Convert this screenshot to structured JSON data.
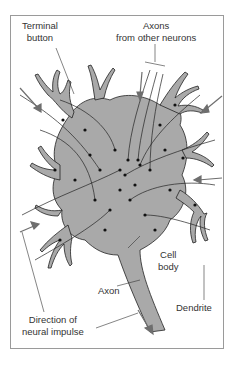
{
  "figure": {
    "labels": {
      "terminal_button": [
        "Terminal",
        "button"
      ],
      "axons_from_other": [
        "Axons",
        "from other neurons"
      ],
      "cell_body": [
        "Cell",
        "body"
      ],
      "axon": "Axon",
      "dendrite": "Dendrite",
      "direction": [
        "Direction of",
        "neural impulse"
      ]
    },
    "colors": {
      "cell_fill": "#a9a9a9",
      "outline": "#222222",
      "arrow": "#6e6e6e",
      "frame": "#9a9a9a"
    }
  }
}
